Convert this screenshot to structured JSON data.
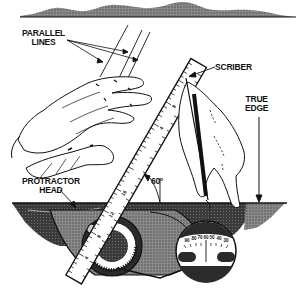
{
  "figure": {
    "labels": {
      "parallel_lines_1": "PARALLEL",
      "parallel_lines_2": "LINES",
      "scriber": "SCRIBER",
      "true_edge_1": "TRUE",
      "true_edge_2": "EDGE",
      "protractor_head_1": "PROTRACTOR",
      "protractor_head_2": "HEAD",
      "angle": "60°"
    },
    "rule_numbers": [
      "4",
      "8",
      "12",
      "16",
      "4",
      "8",
      "12"
    ],
    "dial_numbers": [
      "90",
      "80",
      "70",
      "60",
      "50",
      "40",
      "30"
    ],
    "colors": {
      "ink": "#111111",
      "shade": "#5a5a5a",
      "light_shade": "#9a9a9a",
      "paper": "#ffffff"
    }
  }
}
